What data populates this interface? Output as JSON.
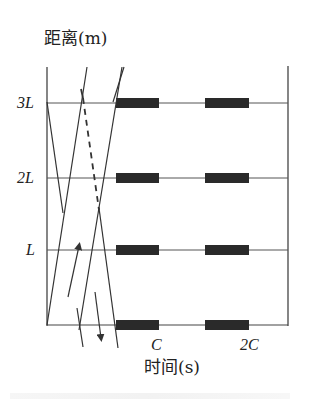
{
  "figure": {
    "y_axis_label": "距离(m)",
    "x_axis_label": "时间(s)",
    "y_ticks": [
      "3L",
      "2L",
      "L"
    ],
    "x_ticks": [
      "C",
      "2C"
    ]
  },
  "colors": {
    "line": "#333333",
    "bar": "#2a2a2a",
    "background": "#ffffff"
  },
  "geometry": {
    "left_axis_x": 47,
    "right_axis_x": 288,
    "level_y": [
      103,
      178,
      250,
      325
    ],
    "bars_x": [
      [
        116,
        159
      ],
      [
        205,
        249
      ]
    ]
  }
}
